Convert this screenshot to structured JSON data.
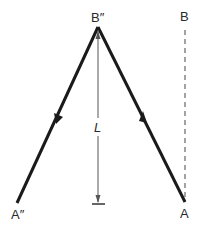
{
  "diagram": {
    "labels": {
      "apex": "B″",
      "top_right": "B",
      "bottom_left": "A″",
      "bottom_right": "A",
      "length": "L"
    },
    "colors": {
      "main_line": "#1a1a1a",
      "guide_line": "#555555",
      "text": "#2a2a2a"
    },
    "arrows": {
      "left_leg": "down",
      "right_leg": "up"
    }
  }
}
